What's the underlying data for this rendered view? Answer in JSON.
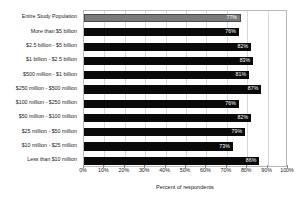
{
  "chart_data": {
    "type": "bar",
    "orientation": "horizontal",
    "title": "",
    "xlabel": "Percent of respondents",
    "ylabel": "",
    "xlim": [
      0,
      100
    ],
    "grid": true,
    "legend": "none",
    "tick_labels": [
      "0%",
      "10%",
      "20%",
      "30%",
      "40%",
      "50%",
      "60%",
      "70%",
      "80%",
      "90%",
      "100%"
    ],
    "tick_values": [
      0,
      10,
      20,
      30,
      40,
      50,
      60,
      70,
      80,
      90,
      100
    ],
    "categories": [
      "Entire Study Population",
      "More than $5 billion",
      "$2.5 billion - $5 billion",
      "$1 billion - $2.5 billion",
      "$500 million - $1 billion",
      "$250 million - $500 million",
      "$100 million - $250 million",
      "$50 million - $100 million",
      "$25 million - $50 million",
      "$10 million - $25 million",
      "Less than $10 million"
    ],
    "values": [
      77,
      76,
      82,
      83,
      81,
      87,
      76,
      82,
      79,
      73,
      86
    ],
    "value_labels": [
      "77%",
      "76%",
      "82%",
      "83%",
      "81%",
      "87%",
      "76%",
      "82%",
      "79%",
      "73%",
      "86%"
    ],
    "highlight_index": 0,
    "colors": {
      "bar": "#0a0a0a",
      "highlight_bar": "#7a7a7a",
      "value_label": "#ffffff",
      "gridline": "#d9d9d9",
      "frame": "#b9b9b9",
      "text": "#1a1a1a",
      "background": "#ffffff"
    }
  }
}
